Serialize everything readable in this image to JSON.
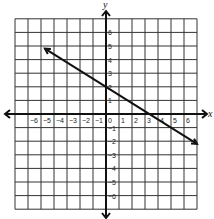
{
  "chart_data": {
    "type": "line",
    "title": "",
    "xlabel": "x",
    "ylabel": "y",
    "xlim": [
      -7,
      7
    ],
    "ylim": [
      -7,
      7
    ],
    "grid": true,
    "x_ticks": [
      -6,
      -5,
      -4,
      -3,
      -2,
      -1,
      0,
      1,
      2,
      3,
      4,
      5,
      6
    ],
    "y_ticks": [
      6,
      5,
      4,
      3,
      2,
      1,
      -1,
      -2,
      -3,
      -4,
      -5,
      -6
    ],
    "x_tick_labels": [
      "−6",
      "−5",
      "−4",
      "−3",
      "−2",
      "−1",
      "0",
      "1",
      "2",
      "3",
      "4",
      "5",
      "6"
    ],
    "y_tick_labels": [
      "6",
      "5",
      "4",
      "3",
      "2",
      "1",
      "−1",
      "−2",
      "−3",
      "−4",
      "−5",
      "−6"
    ],
    "series": [
      {
        "name": "line",
        "equation": "y = -0.6x + 2",
        "x": [
          -4.7,
          7
        ],
        "y": [
          4.8,
          -2.2
        ],
        "arrows": "both"
      }
    ],
    "intercepts": {
      "y_intercept": 2,
      "x_intercept": 3.33
    }
  }
}
